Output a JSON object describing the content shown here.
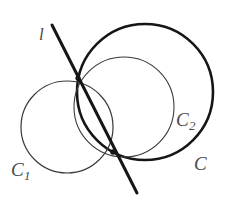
{
  "figure": {
    "type": "geometry-diagram",
    "background_color": "#ffffff",
    "width": 246,
    "height": 208,
    "stroke_colors": {
      "thick_curve": "#161616",
      "thin_curve": "#3a3a3a",
      "label_text": "#4a4a4a"
    },
    "labels": {
      "line": "l",
      "circle_big": "C",
      "circle_left": "C",
      "circle_left_sub": "1",
      "circle_mid": "C",
      "circle_mid_sub": "2"
    },
    "elements": [
      {
        "name": "circle-C",
        "label": "C",
        "kind": "circle",
        "cx": 145,
        "cy": 92,
        "r": 68,
        "stroke_width": 2.6,
        "emphasis": "thick"
      },
      {
        "name": "circle-C2",
        "label": "C2",
        "kind": "circle",
        "cx": 124,
        "cy": 107,
        "r": 50,
        "stroke_width": 1.1,
        "emphasis": "thin"
      },
      {
        "name": "circle-C1",
        "label": "C1",
        "kind": "circle",
        "cx": 67,
        "cy": 127,
        "r": 46,
        "stroke_width": 1.2,
        "emphasis": "thin"
      },
      {
        "name": "line-l",
        "label": "l",
        "kind": "segment",
        "x1": 52,
        "y1": 25,
        "x2": 137,
        "y2": 193,
        "stroke_width": 3.0,
        "emphasis": "thick"
      }
    ],
    "intersection_points": [
      {
        "name": "upper-node",
        "x": 78,
        "y": 78
      },
      {
        "name": "lower-node",
        "x": 113,
        "y": 152
      }
    ]
  }
}
